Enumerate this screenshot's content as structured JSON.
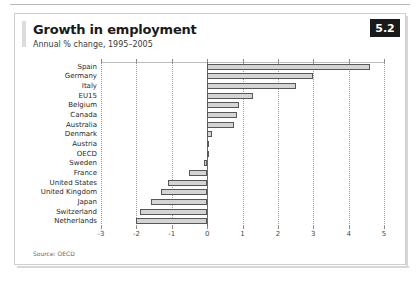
{
  "figure": {
    "title": "Growth in employment",
    "subtitle": "Annual % change, 1995–2005",
    "badge": "5.2",
    "source": "Source: OECD"
  },
  "chart_data": {
    "type": "bar",
    "orientation": "horizontal",
    "title": "Growth in employment",
    "subtitle": "Annual % change, 1995–2005",
    "xlabel": "",
    "ylabel": "",
    "xlim": [
      -3,
      5
    ],
    "xticks": [
      -3,
      -2,
      -1,
      0,
      1,
      2,
      3,
      4,
      5
    ],
    "xtick_labels": [
      "-3",
      "-2",
      "-1",
      "0",
      "1",
      "2",
      "3",
      "4",
      "5"
    ],
    "grid": true,
    "legend": false,
    "bar_fill": "#d4d4d4",
    "bar_edge": "#575757",
    "categories": [
      "Spain",
      "Germany",
      "Italy",
      "EU15",
      "Belgium",
      "Canada",
      "Australia",
      "Denmark",
      "Austria",
      "OECD",
      "Sweden",
      "France",
      "United States",
      "United Kingdom",
      "Japan",
      "Switzerland",
      "Netherlands"
    ],
    "values": [
      4.6,
      3.0,
      2.5,
      1.3,
      0.9,
      0.85,
      0.75,
      0.15,
      0.03,
      0.0,
      -0.1,
      -0.5,
      -1.1,
      -1.3,
      -1.6,
      -1.9,
      -2.0
    ],
    "source": "Source: OECD"
  }
}
